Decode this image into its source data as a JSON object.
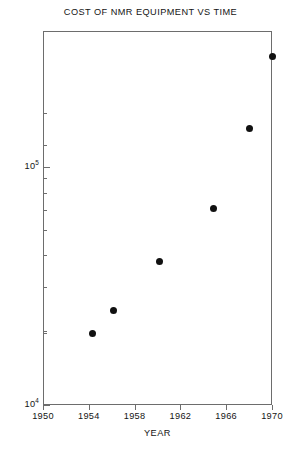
{
  "chart_data": {
    "type": "scatter",
    "title": "COST OF NMR EQUIPMENT VS TIME",
    "xlabel": "YEAR",
    "ylabel": "COST (DOLLARS)",
    "xlim": [
      1950,
      1970
    ],
    "ylim": [
      10000,
      400000
    ],
    "yscale": "log",
    "xscale": "linear",
    "grid": false,
    "legend": null,
    "x_ticks": [
      1950,
      1954,
      1958,
      1962,
      1966,
      1970
    ],
    "x_tick_labels": [
      "1950",
      "1954",
      "1958",
      "1962",
      "1966",
      "1970"
    ],
    "y_ticks_major": [
      10000,
      100000
    ],
    "y_tick_labels": [
      "10⁴",
      "10⁵"
    ],
    "y_ticks_minor": [
      20000,
      30000,
      40000,
      50000,
      60000,
      70000,
      80000,
      90000,
      200000,
      300000
    ],
    "marker": "filled-circle",
    "marker_color": "#111111",
    "points": [
      {
        "x": 1954.3,
        "y": 20000
      },
      {
        "x": 1956.2,
        "y": 25000
      },
      {
        "x": 1960.2,
        "y": 40000
      },
      {
        "x": 1964.9,
        "y": 67000
      },
      {
        "x": 1968.0,
        "y": 145000
      },
      {
        "x": 1970.0,
        "y": 290000
      }
    ]
  },
  "axis": {
    "x_labels": [
      "1950",
      "1954",
      "1958",
      "1962",
      "1966",
      "1970"
    ],
    "y_major_labels": [
      {
        "mantissa": "10",
        "exponent": "5"
      },
      {
        "mantissa": "10",
        "exponent": "4"
      }
    ]
  },
  "colors": {
    "frame": "#6d6d6d",
    "marker": "#111111",
    "text": "#141414",
    "background": "#ffffff"
  }
}
